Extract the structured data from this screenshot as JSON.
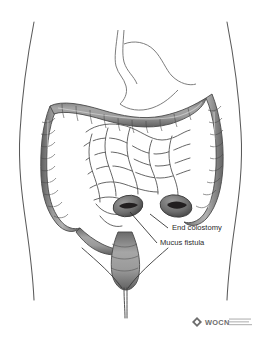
{
  "figure": {
    "background_color": "#ffffff"
  },
  "annotations": [
    {
      "id": "end-colostomy",
      "label": "End colostomy",
      "text_x": 172,
      "text_y": 230,
      "leader": "M168,228 L150,214",
      "anchor_x": 150,
      "anchor_y": 214
    },
    {
      "id": "mucus-fistula",
      "label": "Mucus fistula",
      "text_x": 160,
      "text_y": 245,
      "leader": "M157,243 L130,212",
      "anchor_x": 130,
      "anchor_y": 212
    }
  ],
  "anatomy": {
    "body_outline": {
      "name": "torso-outline",
      "stroke": "#555555"
    },
    "colon": {
      "name": "large-intestine",
      "fill": "#8a8a8a",
      "stroke": "#4a4a4a"
    },
    "small_intestine": {
      "name": "small-intestine",
      "fill": "#ffffff",
      "stroke": "#3c3c3c"
    },
    "stomach": {
      "name": "stomach",
      "fill": "#ffffff",
      "stroke": "#6e6e6e"
    },
    "rectum": {
      "name": "rectum",
      "fill": "#8a8a8a",
      "stroke": "#4a4a4a"
    },
    "stoma_end_colostomy": {
      "name": "stoma-end-colostomy",
      "fill": "#6a6a6a",
      "slit": "#231f20"
    },
    "stoma_mucus_fistula": {
      "name": "stoma-mucus-fistula",
      "fill": "#6a6a6a",
      "slit": "#231f20"
    }
  },
  "logo": {
    "wordmark": "WOCN",
    "mark": "diamond-icon",
    "mark_color": "#6d6d6d",
    "tagline_lines": [
      "",
      "",
      ""
    ]
  }
}
